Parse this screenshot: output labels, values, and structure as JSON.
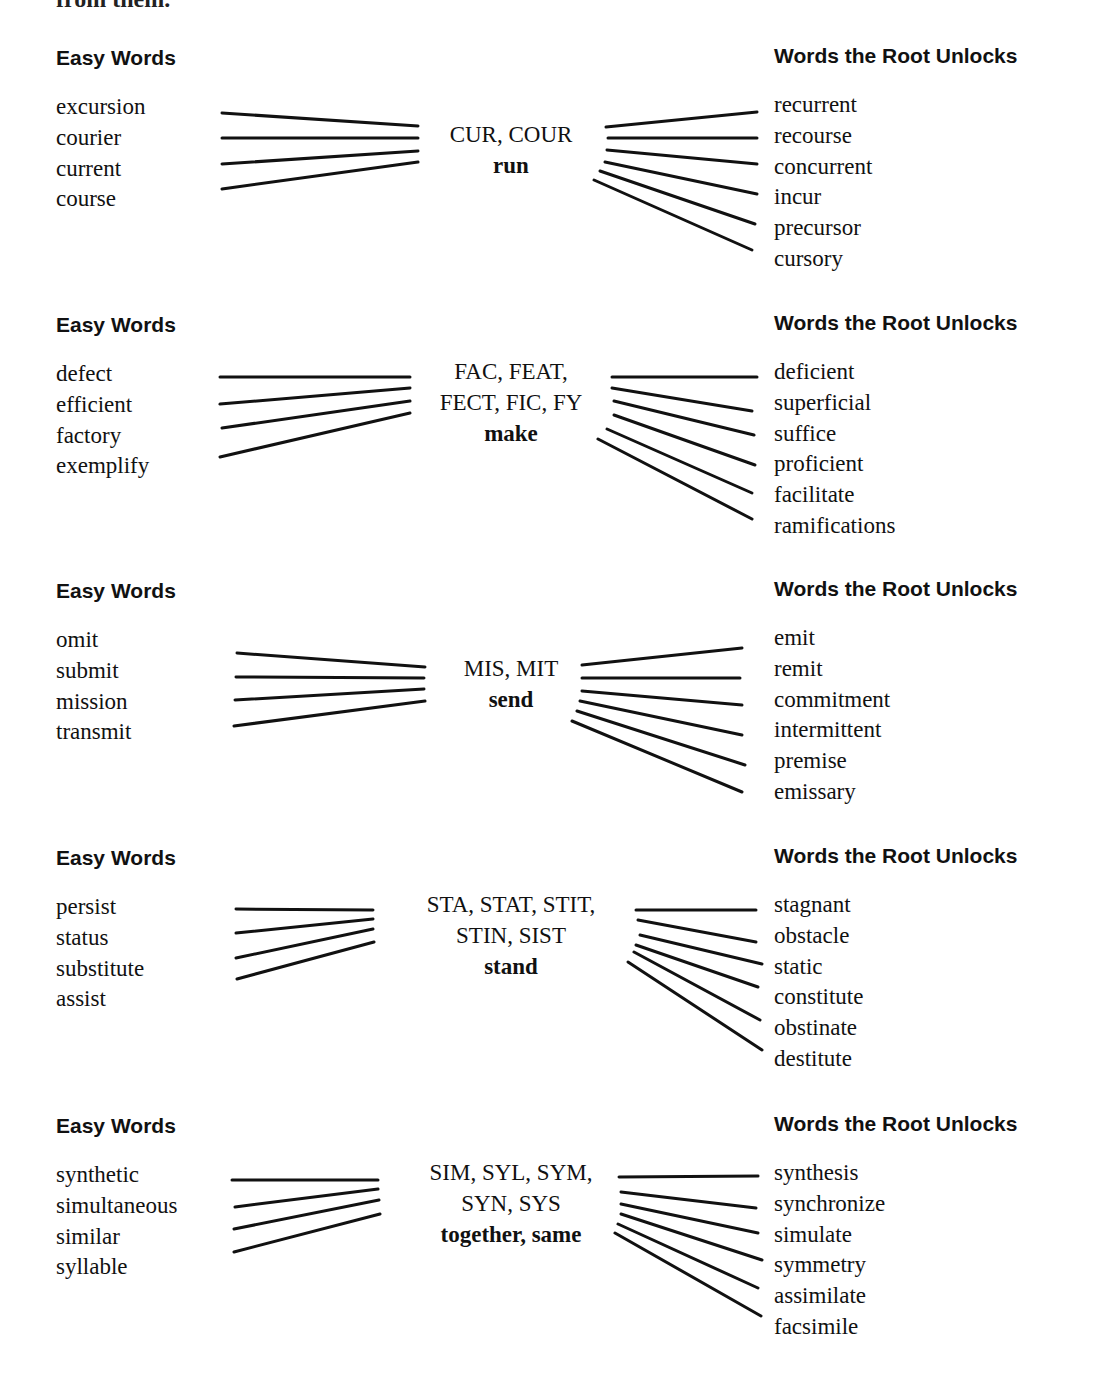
{
  "page": {
    "top_fragment": "from them."
  },
  "labels": {
    "easy_words": "Easy Words",
    "root_unlocks": "Words the Root Unlocks"
  },
  "sections": [
    {
      "top": 40,
      "root_forms": [
        "CUR, COUR"
      ],
      "meaning": "run",
      "root_center_x": 511,
      "root_top": 80,
      "easy_words": [
        "excursion",
        "courier",
        "current",
        "course"
      ],
      "unlocked_words": [
        "recurrent",
        "recourse",
        "concurrent",
        "incur",
        "precursor",
        "cursory"
      ],
      "easy_top": 52,
      "unlocked_top": 50,
      "left_lines": [
        [
          222,
          73,
          418,
          86
        ],
        [
          222,
          98,
          418,
          98
        ],
        [
          222,
          124,
          418,
          111
        ],
        [
          222,
          149,
          418,
          122
        ]
      ],
      "right_lines": [
        [
          606,
          87,
          757,
          72
        ],
        [
          608,
          98,
          757,
          98
        ],
        [
          607,
          110,
          757,
          124
        ],
        [
          605,
          122,
          757,
          154
        ],
        [
          600,
          131,
          755,
          184
        ],
        [
          594,
          140,
          752,
          210
        ]
      ]
    },
    {
      "top": 307,
      "root_forms": [
        "FAC, FEAT,",
        "FECT, FIC, FY"
      ],
      "meaning": "make",
      "root_center_x": 511,
      "root_top": 50,
      "easy_words": [
        "defect",
        "efficient",
        "factory",
        "exemplify"
      ],
      "unlocked_words": [
        "deficient",
        "superficial",
        "suffice",
        "proficient",
        "facilitate",
        "ramifications"
      ],
      "easy_top": 52,
      "unlocked_top": 50,
      "left_lines": [
        [
          220,
          70,
          410,
          70
        ],
        [
          220,
          97,
          410,
          81
        ],
        [
          222,
          121,
          410,
          94
        ],
        [
          220,
          150,
          410,
          106
        ]
      ],
      "right_lines": [
        [
          612,
          70,
          757,
          70
        ],
        [
          612,
          81,
          752,
          104
        ],
        [
          614,
          94,
          754,
          128
        ],
        [
          614,
          108,
          755,
          158
        ],
        [
          607,
          122,
          752,
          186
        ],
        [
          598,
          132,
          752,
          212
        ]
      ]
    },
    {
      "top": 573,
      "root_forms": [
        "MIS, MIT"
      ],
      "meaning": "send",
      "root_center_x": 511,
      "root_top": 81,
      "easy_words": [
        "omit",
        "submit",
        "mission",
        "transmit"
      ],
      "unlocked_words": [
        "emit",
        "remit",
        "commitment",
        "intermittent",
        "premise",
        "emissary"
      ],
      "easy_top": 52,
      "unlocked_top": 50,
      "left_lines": [
        [
          197,
          80,
          385,
          94
        ],
        [
          196,
          104,
          384,
          105
        ],
        [
          195,
          127,
          384,
          116
        ],
        [
          194,
          153,
          385,
          128
        ]
      ],
      "right_lines": [
        [
          22,
          92,
          182,
          75
        ],
        [
          22,
          105,
          180,
          105
        ],
        [
          22,
          118,
          182,
          132
        ],
        [
          20,
          128,
          182,
          162
        ],
        [
          17,
          138,
          185,
          192
        ],
        [
          12,
          148,
          182,
          219
        ]
      ],
      "right_offset": 560
    },
    {
      "top": 840,
      "root_forms": [
        "STA, STAT, STIT,",
        "STIN, SIST"
      ],
      "meaning": "stand",
      "root_center_x": 511,
      "root_top": 50,
      "easy_words": [
        "persist",
        "status",
        "substitute",
        "assist"
      ],
      "unlocked_words": [
        "stagnant",
        "obstacle",
        "static",
        "constitute",
        "obstinate",
        "destitute"
      ],
      "easy_top": 52,
      "unlocked_top": 50,
      "left_lines": [
        [
          196,
          69,
          333,
          70
        ],
        [
          196,
          93,
          333,
          79
        ],
        [
          196,
          118,
          333,
          89
        ],
        [
          197,
          139,
          334,
          102
        ]
      ],
      "right_lines": [
        [
          36,
          70,
          156,
          70
        ],
        [
          38,
          80,
          156,
          102
        ],
        [
          40,
          95,
          162,
          124
        ],
        [
          36,
          105,
          158,
          147
        ],
        [
          34,
          112,
          160,
          180
        ],
        [
          28,
          122,
          162,
          210
        ]
      ],
      "right_offset": 600
    },
    {
      "top": 1108,
      "root_forms": [
        "SIM, SYL, SYM,",
        "SYN, SYS"
      ],
      "meaning": "together, same",
      "root_center_x": 511,
      "root_top": 50,
      "easy_words": [
        "synthetic",
        "simultaneous",
        "similar",
        "syllable"
      ],
      "unlocked_words": [
        "synthesis",
        "synchronize",
        "simulate",
        "symmetry",
        "assimilate",
        "facsimile"
      ],
      "easy_top": 52,
      "unlocked_top": 50,
      "left_lines": [
        [
          192,
          72,
          338,
          72
        ],
        [
          195,
          99,
          338,
          81
        ],
        [
          194,
          121,
          339,
          92
        ],
        [
          194,
          144,
          340,
          106
        ]
      ],
      "right_lines": [
        [
          19,
          69,
          158,
          68
        ],
        [
          21,
          84,
          156,
          100
        ],
        [
          21,
          96,
          158,
          125
        ],
        [
          21,
          106,
          162,
          152
        ],
        [
          18,
          116,
          158,
          180
        ],
        [
          15,
          125,
          161,
          208
        ]
      ],
      "right_offset": 600
    }
  ]
}
